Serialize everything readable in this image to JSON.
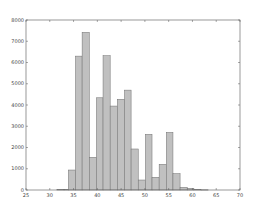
{
  "chart_data": {
    "type": "bar",
    "subtype": "histogram",
    "title": "",
    "xlabel": "",
    "ylabel": "",
    "xlim": [
      25,
      70
    ],
    "ylim": [
      0,
      8000
    ],
    "xticks": [
      25,
      30,
      35,
      40,
      45,
      50,
      55,
      60,
      65,
      70
    ],
    "yticks": [
      0,
      1000,
      2000,
      3000,
      4000,
      5000,
      6000,
      7000,
      8000
    ],
    "grid": false,
    "legend": null,
    "bin_width": 1.47,
    "bins": [
      {
        "x0": 30.0,
        "x1": 31.5,
        "count": 0
      },
      {
        "x0": 31.5,
        "x1": 33.0,
        "count": 20
      },
      {
        "x0": 33.0,
        "x1": 33.9,
        "count": 20
      },
      {
        "x0": 33.9,
        "x1": 35.4,
        "count": 940
      },
      {
        "x0": 35.4,
        "x1": 36.8,
        "count": 6300
      },
      {
        "x0": 36.8,
        "x1": 38.3,
        "count": 7420
      },
      {
        "x0": 38.3,
        "x1": 39.8,
        "count": 1540
      },
      {
        "x0": 39.8,
        "x1": 41.2,
        "count": 4340
      },
      {
        "x0": 41.2,
        "x1": 42.7,
        "count": 6320
      },
      {
        "x0": 42.7,
        "x1": 44.2,
        "count": 3950
      },
      {
        "x0": 44.2,
        "x1": 45.7,
        "count": 4270
      },
      {
        "x0": 45.7,
        "x1": 47.1,
        "count": 4700
      },
      {
        "x0": 47.1,
        "x1": 48.6,
        "count": 1930
      },
      {
        "x0": 48.6,
        "x1": 50.1,
        "count": 470
      },
      {
        "x0": 50.1,
        "x1": 51.5,
        "count": 2620
      },
      {
        "x0": 51.5,
        "x1": 53.0,
        "count": 600
      },
      {
        "x0": 53.0,
        "x1": 54.5,
        "count": 1210
      },
      {
        "x0": 54.5,
        "x1": 55.9,
        "count": 2710
      },
      {
        "x0": 55.9,
        "x1": 57.4,
        "count": 770
      },
      {
        "x0": 57.4,
        "x1": 58.9,
        "count": 125
      },
      {
        "x0": 58.9,
        "x1": 60.3,
        "count": 80
      },
      {
        "x0": 60.3,
        "x1": 61.8,
        "count": 30
      },
      {
        "x0": 61.8,
        "x1": 63.3,
        "count": 10
      }
    ],
    "colors": {
      "bar_fill": "#c0c0c0",
      "bar_edge": "#6e6e6e",
      "axis": "#555555"
    }
  }
}
